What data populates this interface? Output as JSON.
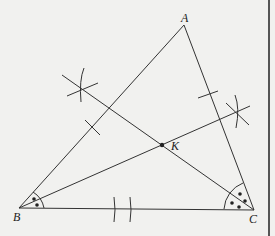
{
  "diagram": {
    "type": "triangle-angle-bisectors",
    "colors": {
      "background": "#f1f1ef",
      "stroke": "#333333",
      "text": "#222222",
      "border": "#555555"
    },
    "points": {
      "A": {
        "label": "A",
        "x": 184,
        "y": 25
      },
      "B": {
        "label": "B",
        "x": 19,
        "y": 208
      },
      "C": {
        "label": "C",
        "x": 254,
        "y": 210
      },
      "K": {
        "label": "K",
        "x": 162,
        "y": 145
      }
    },
    "segments": [
      {
        "name": "side-AB",
        "from": "A",
        "to": "B"
      },
      {
        "name": "side-AC",
        "from": "A",
        "to": "C"
      },
      {
        "name": "side-BC",
        "from": "B",
        "to": "C"
      },
      {
        "name": "bisector-from-B",
        "from": "B",
        "through": "K"
      },
      {
        "name": "bisector-from-C",
        "from": "C",
        "through": "K"
      }
    ],
    "annotations": {
      "angle_B_marks": 2,
      "angle_C_marks": 4,
      "side_AB_tick": 1,
      "side_AC_tick": 1,
      "side_BC_ticks": 2,
      "construction_crosses": 2
    }
  }
}
